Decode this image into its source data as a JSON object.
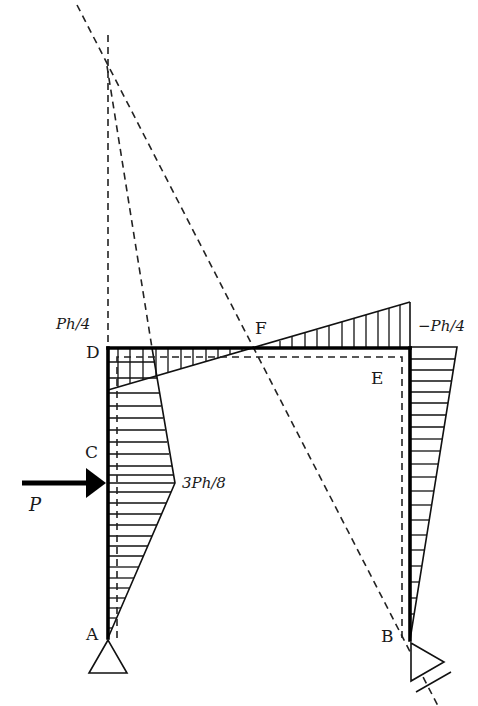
{
  "diagram": {
    "type": "portal frame bending moment diagram with instantaneous centers",
    "nodes": {
      "A": "A",
      "B": "B",
      "C": "C",
      "D": "D",
      "E": "E",
      "F": "F"
    },
    "load": {
      "label": "P",
      "direction": "right",
      "at": "column AD below C"
    },
    "moment_labels": {
      "at_D": "Ph/4",
      "at_E": "−Ph/4",
      "at_load": "3Ph/8"
    },
    "supports": {
      "A": "pin",
      "B": "roller (inclined)"
    },
    "colors": {
      "line": "#111111",
      "background": "#ffffff"
    }
  }
}
